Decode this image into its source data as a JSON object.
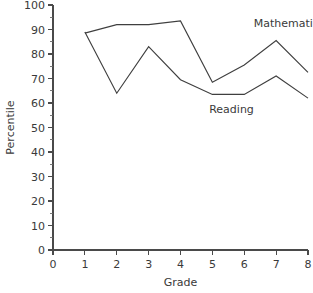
{
  "chart_data": {
    "type": "line",
    "title": "",
    "xlabel": "Grade",
    "ylabel": "Percentile",
    "xlim": [
      0,
      8
    ],
    "ylim": [
      0,
      100
    ],
    "grid": false,
    "legend_position": "inline-annotations",
    "x": [
      1,
      2,
      3,
      4,
      5,
      6,
      7,
      8
    ],
    "xticks": [
      "0",
      "1",
      "2",
      "3",
      "4",
      "5",
      "6",
      "7",
      "8"
    ],
    "xtick_values": [
      0,
      1,
      2,
      3,
      4,
      5,
      6,
      7,
      8
    ],
    "yticks": [
      "0",
      "10",
      "20",
      "30",
      "40",
      "50",
      "60",
      "70",
      "80",
      "90",
      "100"
    ],
    "ytick_values": [
      0,
      10,
      20,
      30,
      40,
      50,
      60,
      70,
      80,
      90,
      100
    ],
    "series": [
      {
        "name": "Mathematics",
        "values": [
          88.5,
          92,
          92,
          93.5,
          68.5,
          75.5,
          85.5,
          72.5
        ],
        "label_text": "Mathematics"
      },
      {
        "name": "Reading",
        "values": [
          89,
          64,
          83,
          69.5,
          63.5,
          63.5,
          71,
          62
        ],
        "label_text": "Reading"
      }
    ],
    "annotations": [
      {
        "text": "Mathematics",
        "x": 6.3,
        "y": 91
      },
      {
        "text": "Reading",
        "x": 4.9,
        "y": 56
      }
    ],
    "colors": {
      "line": "#3f3f3f",
      "axis": "#4a4a4a",
      "text": "#3a3a3a",
      "background": "#ffffff"
    }
  }
}
